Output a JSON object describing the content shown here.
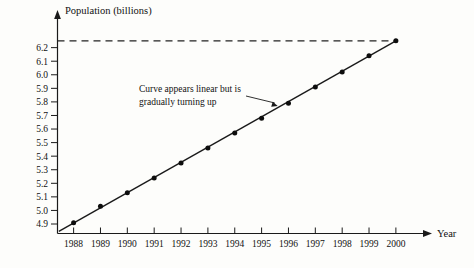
{
  "chart_data": {
    "type": "scatter",
    "title": "",
    "xlabel": "Year",
    "ylabel": "Population (billions)",
    "categories": [
      "1988",
      "1989",
      "1990",
      "1991",
      "1992",
      "1993",
      "1994",
      "1995",
      "1996",
      "1997",
      "1998",
      "1999",
      "2000"
    ],
    "x": [
      1988,
      1989,
      1990,
      1991,
      1992,
      1993,
      1994,
      1995,
      1996,
      1997,
      1998,
      1999,
      2000
    ],
    "values": [
      4.91,
      5.03,
      5.13,
      5.24,
      5.35,
      5.46,
      5.57,
      5.68,
      5.79,
      5.91,
      6.02,
      6.14,
      6.25
    ],
    "series": [
      {
        "name": "World population",
        "values": [
          4.91,
          5.03,
          5.13,
          5.24,
          5.35,
          5.46,
          5.57,
          5.68,
          5.79,
          5.91,
          6.02,
          6.14,
          6.25
        ]
      }
    ],
    "ytick_labels": [
      "6.2",
      "6.1",
      "6.0",
      "5.9",
      "5.8",
      "5.7",
      "5.6",
      "5.5",
      "5.4",
      "5.3",
      "5.2",
      "5.1",
      "5.0",
      "4.9"
    ],
    "ytick_values": [
      6.2,
      6.1,
      6.0,
      5.9,
      5.8,
      5.7,
      5.6,
      5.5,
      5.4,
      5.3,
      5.2,
      5.1,
      5.0,
      4.9
    ],
    "ylim": [
      4.83,
      6.33
    ],
    "xlim": [
      1987.4,
      2000.6
    ],
    "grid": false,
    "legend": "none",
    "trendline": {
      "name": "fitted-line",
      "description": "straight reference line through the data",
      "x_start": 1987.45,
      "y_start": 4.845,
      "x_end": 2000.0,
      "y_end": 6.25
    },
    "reference_line": {
      "name": "dashed-reference",
      "orientation": "horizontal",
      "value": 6.25,
      "style": "dashed"
    },
    "annotations": [
      {
        "text_line_1": "Curve appears linear but is",
        "text_line_2": "gradually turning up",
        "target_x": 1995.6,
        "target_y": 5.77
      }
    ]
  },
  "axis": {
    "y_title": "Population (billions)",
    "x_title": "Year"
  }
}
